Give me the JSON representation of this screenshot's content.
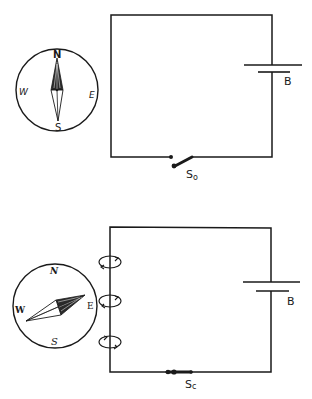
{
  "figure": {
    "top_panel": {
      "compass": {
        "north": "N",
        "south": "S",
        "east": "E",
        "west": "W",
        "needle_direction": "north"
      },
      "battery_label": "B",
      "switch_label": "S",
      "switch_subscript": "o",
      "switch_state": "open"
    },
    "bottom_panel": {
      "compass": {
        "north": "N",
        "south": "S",
        "east": "E",
        "west": "W",
        "needle_direction": "east-northeast"
      },
      "battery_label": "B",
      "switch_label": "S",
      "switch_subscript": "c",
      "switch_state": "closed",
      "field_loops": 3
    }
  },
  "colors": {
    "ink": "#1a1a1a",
    "background": "#ffffff"
  }
}
